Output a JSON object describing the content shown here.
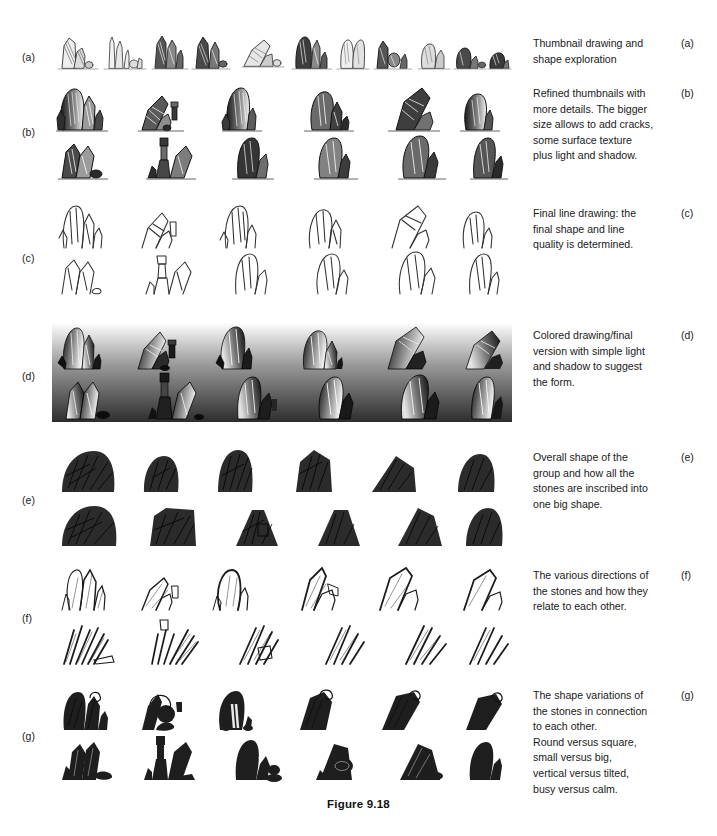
{
  "figure": {
    "caption": "Figure 9.18",
    "page_background": "#ffffff",
    "ink_color": "#1a1a1a"
  },
  "rows": [
    {
      "tag": "(a)",
      "label": "(a)",
      "caption": "Thumbnail drawing and\nshape exploration",
      "panel": {
        "style": "thumbnail-sketch",
        "columns": 12,
        "rows": 1,
        "background": "#ffffff",
        "stroke": "#2a2a2a",
        "ground_line": true
      }
    },
    {
      "tag": "(b)",
      "label": "(b)",
      "caption": "Refined thumbnails with\nmore details. The bigger\nsize allows to add cracks,\nsome surface texture\nplus light and shadow.",
      "panel": {
        "style": "refined-thumbnail",
        "columns": 5,
        "rows": 2,
        "background": "#ffffff",
        "stroke": "#222222",
        "ground_line": true
      }
    },
    {
      "tag": "(c)",
      "label": "(c)",
      "caption": "Final line drawing: the\nfinal shape and line\nquality is determined.",
      "panel": {
        "style": "line-drawing",
        "columns": 5,
        "rows": 2,
        "background": "#ffffff",
        "stroke": "#303030",
        "ground_line": false
      }
    },
    {
      "tag": "(d)",
      "label": "(d)",
      "caption": "Colored drawing/final\nversion with simple light\nand shadow to suggest\nthe form.",
      "panel": {
        "style": "colored-gradient",
        "columns": 5,
        "rows": 2,
        "background_gradient_top": "#fdfdfd",
        "background_gradient_bottom": "#2d2d2d",
        "stroke": "#0d0d0d",
        "ground_line": false
      }
    },
    {
      "tag": "(e)",
      "label": "(e)",
      "caption": "Overall shape of the\ngroup and how all the\nstones are inscribed into\none big shape.",
      "panel": {
        "style": "silhouette-mass",
        "columns": 5,
        "rows": 2,
        "background": "#ffffff",
        "fill": "#2b2b2b",
        "stroke": "#000000",
        "ground_line": false
      }
    },
    {
      "tag": "(f)",
      "label": "(f)",
      "caption": "The various directions of\nthe stones and how they\nrelate to each other.",
      "panel": {
        "style": "direction-lines",
        "columns": 5,
        "rows": 2,
        "background": "#ffffff",
        "stroke": "#1c1c1c",
        "ground_line": false
      }
    },
    {
      "tag": "(g)",
      "label": "(g)",
      "caption": "The shape variations of\nthe stones in connection\nto each other.\nRound versus square,\nsmall versus big,\nvertical versus tilted,\nbusy versus calm.",
      "panel": {
        "style": "shape-variation-silhouette",
        "columns": 5,
        "rows": 2,
        "background": "#ffffff",
        "fill": "#1e1e1e",
        "stroke": "#000000",
        "ground_line": false
      }
    }
  ]
}
